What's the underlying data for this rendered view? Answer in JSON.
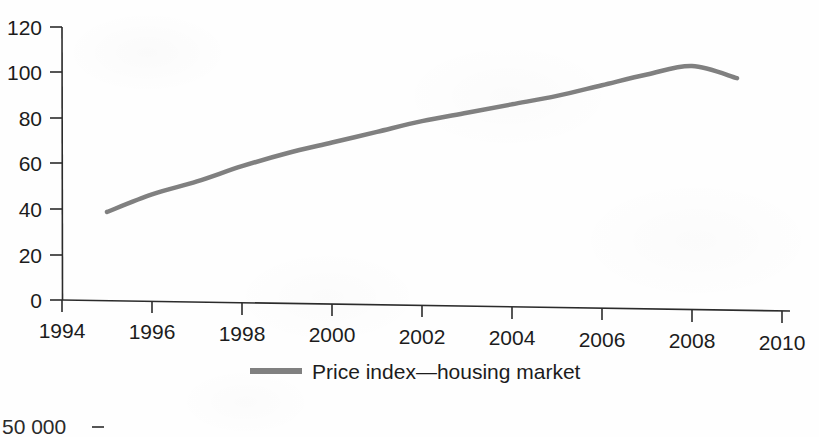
{
  "figure": {
    "background_color": "#fefefe",
    "axis_color": "#2b2b2b",
    "text_color": "#1c1c1c"
  },
  "legend": {
    "position": "bottom-center",
    "entries": [
      {
        "label": "Price index—housing market",
        "color": "#808080",
        "swatch_name": "legend-swatch-price-index"
      }
    ]
  },
  "next_figure_fragment": {
    "label": "50 000",
    "note": "partially cropped y-axis label of the following figure"
  },
  "chart_data": {
    "type": "line",
    "title": "",
    "subtitle": "",
    "xlabel": "",
    "ylabel": "",
    "xlim": [
      1994,
      2010
    ],
    "ylim": [
      0,
      120
    ],
    "xticks": [
      1994,
      1996,
      1998,
      2000,
      2002,
      2004,
      2006,
      2008,
      2010
    ],
    "xtick_labels": [
      "1994",
      "1996",
      "1998",
      "2000",
      "2002",
      "2004",
      "2006",
      "2008",
      "2010"
    ],
    "yticks": [
      0,
      20,
      40,
      60,
      80,
      100,
      120
    ],
    "ytick_labels": [
      "0",
      "20",
      "40",
      "60",
      "80",
      "100",
      "120"
    ],
    "grid": false,
    "legend_position": "bottom-center",
    "series": [
      {
        "name": "Price index—housing market",
        "color": "#808080",
        "line_width": 4.5,
        "x": [
          1995,
          1996,
          1997,
          1998,
          1999,
          2000,
          2001,
          2002,
          2003,
          2004,
          2005,
          2006,
          2007,
          2008,
          2009
        ],
        "values": [
          39,
          47,
          53,
          60,
          66,
          71,
          76,
          81,
          85,
          89,
          93,
          98,
          103,
          107,
          102
        ]
      }
    ]
  }
}
